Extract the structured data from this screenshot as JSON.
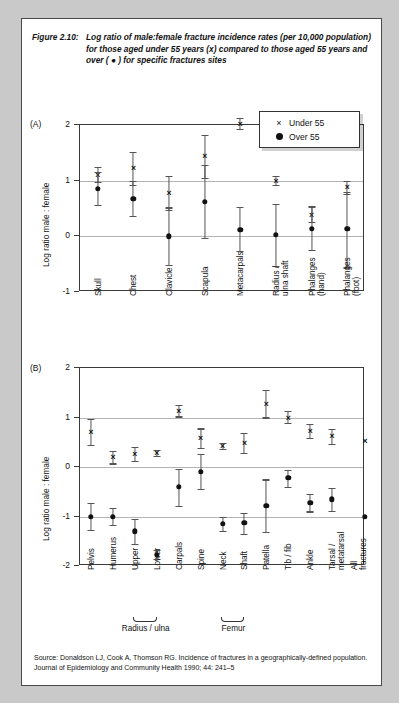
{
  "caption": {
    "figure_number": "Figure 2.10:",
    "text": "Log ratio of male:female fracture incidence rates (per 10,000 population) for those aged under 55 years (x) compared to those aged 55 years and over ( ● ) for specific fractures sites"
  },
  "legend": {
    "under_glyph": "×",
    "under_label": "Under 55",
    "over_glyph": "●",
    "over_label": "Over 55"
  },
  "source": "Source: Donaldson LJ, Cook A, Thomson RG. Incidence of fractures in a geographically-defined population. Journal of Epidemiology and Community Health 1990; 44: 241–5",
  "panelA": {
    "tag": "(A)",
    "ylabel": "Log ratio male : female",
    "yticks": [
      "2",
      "1",
      "0",
      "-1"
    ]
  },
  "panelB": {
    "tag": "(B)",
    "ylabel": "Log ratio male : female",
    "yticks": [
      "2",
      "1",
      "0",
      "-1",
      "-2"
    ],
    "groups": [
      {
        "label": "Radius / ulna",
        "from": 2,
        "to": 3
      },
      {
        "label": "Femur",
        "from": 6,
        "to": 7
      }
    ]
  },
  "chart_data": [
    {
      "type": "scatter",
      "title": "(A) Log ratio of male:female fracture incidence rates — upper body / extremity sites",
      "xlabel": "",
      "ylabel": "Log ratio male : female",
      "ylim": [
        -1,
        2
      ],
      "grid": true,
      "legend_position": "top-right",
      "categories": [
        "Skull",
        "Chest",
        "Clavicle",
        "Scapula",
        "Metacarpals",
        "Radius /\nulna shaft",
        "Phalanges\n(hand)",
        "Phalanges\n(foot)"
      ],
      "series": [
        {
          "name": "Under 55",
          "marker": "x",
          "values": [
            1.1,
            1.23,
            0.78,
            1.45,
            2.02,
            1.0,
            0.38,
            0.88
          ],
          "ci_low": [
            0.97,
            0.93,
            0.47,
            1.05,
            1.93,
            0.92,
            0.25,
            0.76
          ],
          "ci_high": [
            1.25,
            1.52,
            1.08,
            1.82,
            2.12,
            1.09,
            0.53,
            1.0
          ]
        },
        {
          "name": "Over 55",
          "marker": "dot",
          "values": [
            0.86,
            0.68,
            0.0,
            0.62,
            0.12,
            0.03,
            0.14,
            0.13
          ],
          "ci_low": [
            0.56,
            0.37,
            -0.52,
            -0.03,
            -0.27,
            -0.54,
            -0.25,
            -0.56
          ],
          "ci_high": [
            1.16,
            0.99,
            0.52,
            1.29,
            0.52,
            0.58,
            0.55,
            0.8
          ]
        }
      ]
    },
    {
      "type": "scatter",
      "title": "(B) Log ratio of male:female fracture incidence rates — limb / axial sites",
      "xlabel": "",
      "ylabel": "Log ratio male : female",
      "ylim": [
        -2,
        2
      ],
      "grid": true,
      "legend_position": "none",
      "categories": [
        "Pelvis",
        "Humerus",
        "Upper",
        "Lower",
        "Carpals",
        "Spine",
        "Neck",
        "Shaft",
        "Patella",
        "Tib / fib",
        "Ankle",
        "Tarsal /\nmetatarsal",
        "All\nfractures"
      ],
      "series": [
        {
          "name": "Under 55",
          "marker": "x",
          "values": [
            0.71,
            0.2,
            0.26,
            0.28,
            1.13,
            0.58,
            0.43,
            0.48,
            1.28,
            1.0,
            0.73,
            0.62,
            0.52
          ],
          "ci_low": [
            0.44,
            0.07,
            0.12,
            0.22,
            1.02,
            0.38,
            0.37,
            0.28,
            1.0,
            0.88,
            0.58,
            0.47,
            null
          ],
          "ci_high": [
            0.97,
            0.33,
            0.4,
            0.34,
            1.25,
            0.78,
            0.49,
            0.69,
            1.56,
            1.13,
            0.88,
            0.77,
            null
          ]
        },
        {
          "name": "Over 55",
          "marker": "dot",
          "values": [
            -1.0,
            -1.0,
            -1.3,
            -1.77,
            -0.4,
            -0.1,
            -1.15,
            -1.13,
            -0.78,
            -0.22,
            -0.72,
            -0.65,
            -1.0
          ],
          "ci_low": [
            -1.28,
            -1.18,
            -1.55,
            -1.86,
            -0.78,
            -0.45,
            -1.3,
            -1.35,
            -1.32,
            -0.4,
            -0.9,
            -0.88,
            null
          ],
          "ci_high": [
            -0.72,
            -0.82,
            -1.05,
            -1.68,
            -0.03,
            0.26,
            -1.0,
            -0.92,
            -0.25,
            -0.05,
            -0.55,
            -0.42,
            null
          ]
        }
      ]
    }
  ]
}
